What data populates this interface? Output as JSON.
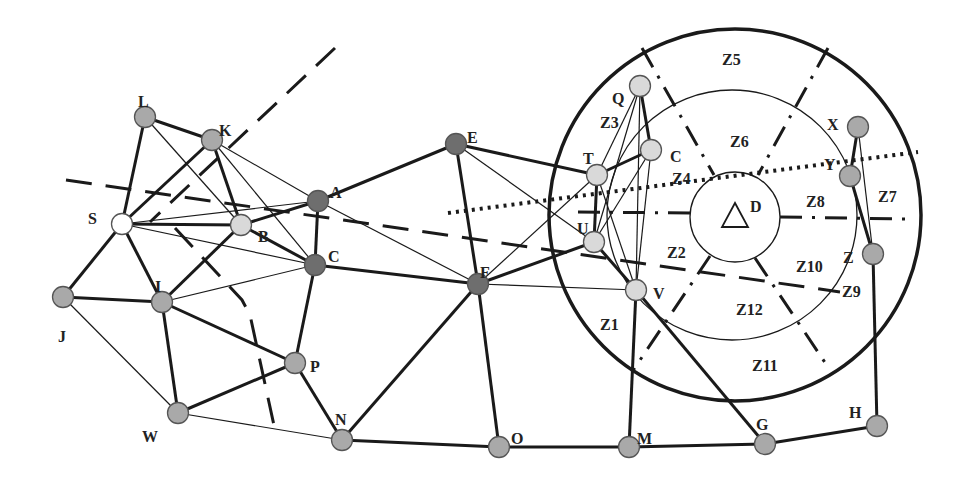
{
  "diagram": {
    "type": "network-graph-with-zones",
    "colors": {
      "edge": "#1a1a1a",
      "node_gray": "#a9a9a9",
      "node_dark": "#6e6e6e",
      "node_light": "#d9d9d9",
      "node_white": "#ffffff",
      "node_stroke": "#555555"
    },
    "nodes": [
      {
        "id": "L",
        "label": "L",
        "x": 145,
        "y": 117,
        "shade": "gray",
        "lx": 138,
        "ly": 95
      },
      {
        "id": "K",
        "label": "K",
        "x": 212,
        "y": 140,
        "shade": "gray",
        "lx": 219,
        "ly": 124
      },
      {
        "id": "S",
        "label": "S",
        "x": 122,
        "y": 224,
        "shade": "white",
        "lx": 88,
        "ly": 212
      },
      {
        "id": "B",
        "label": "B",
        "x": 241,
        "y": 225,
        "shade": "light",
        "lx": 258,
        "ly": 230
      },
      {
        "id": "A",
        "label": "A",
        "x": 318,
        "y": 201,
        "shade": "dark",
        "lx": 330,
        "ly": 186
      },
      {
        "id": "C",
        "label": "C",
        "x": 315,
        "y": 265,
        "shade": "dark",
        "lx": 328,
        "ly": 250
      },
      {
        "id": "I",
        "label": "I",
        "x": 162,
        "y": 302,
        "shade": "gray",
        "lx": 155,
        "ly": 280
      },
      {
        "id": "J",
        "label": "J",
        "x": 63,
        "y": 297,
        "shade": "gray",
        "lx": 58,
        "ly": 330
      },
      {
        "id": "P",
        "label": "P",
        "x": 295,
        "y": 363,
        "shade": "gray",
        "lx": 310,
        "ly": 360
      },
      {
        "id": "W",
        "label": "W",
        "x": 178,
        "y": 413,
        "shade": "gray",
        "lx": 142,
        "ly": 430
      },
      {
        "id": "N",
        "label": "N",
        "x": 342,
        "y": 440,
        "shade": "gray",
        "lx": 335,
        "ly": 413
      },
      {
        "id": "E",
        "label": "E",
        "x": 456,
        "y": 144,
        "shade": "dark",
        "lx": 467,
        "ly": 131
      },
      {
        "id": "F",
        "label": "F",
        "x": 478,
        "y": 284,
        "shade": "dark",
        "lx": 480,
        "ly": 266
      },
      {
        "id": "O",
        "label": "O",
        "x": 499,
        "y": 447,
        "shade": "gray",
        "lx": 511,
        "ly": 432
      },
      {
        "id": "T",
        "label": "T",
        "x": 597,
        "y": 175,
        "shade": "light",
        "lx": 583,
        "ly": 152
      },
      {
        "id": "U",
        "label": "U",
        "x": 594,
        "y": 242,
        "shade": "light",
        "lx": 577,
        "ly": 222
      },
      {
        "id": "V",
        "label": "V",
        "x": 636,
        "y": 290,
        "shade": "light",
        "lx": 653,
        "ly": 287
      },
      {
        "id": "Q",
        "label": "Q",
        "x": 640,
        "y": 86,
        "shade": "light",
        "lx": 612,
        "ly": 92
      },
      {
        "id": "C2",
        "label": "C",
        "x": 651,
        "y": 150,
        "shade": "light",
        "lx": 670,
        "ly": 150
      },
      {
        "id": "X",
        "label": "X",
        "x": 858,
        "y": 127,
        "shade": "gray",
        "lx": 827,
        "ly": 118
      },
      {
        "id": "Y",
        "label": "Y",
        "x": 850,
        "y": 176,
        "shade": "gray",
        "lx": 824,
        "ly": 158
      },
      {
        "id": "Z",
        "label": "Z",
        "x": 873,
        "y": 254,
        "shade": "gray",
        "lx": 843,
        "ly": 251
      },
      {
        "id": "H",
        "label": "H",
        "x": 877,
        "y": 426,
        "shade": "gray",
        "lx": 849,
        "ly": 406
      },
      {
        "id": "G",
        "label": "G",
        "x": 765,
        "y": 444,
        "shade": "gray",
        "lx": 756,
        "ly": 418
      },
      {
        "id": "M",
        "label": "M",
        "x": 629,
        "y": 447,
        "shade": "gray",
        "lx": 637,
        "ly": 432
      }
    ],
    "base_station": {
      "label": "D",
      "x": 735,
      "y": 216,
      "lx": 750,
      "ly": 200
    },
    "zones": [
      {
        "label": "Z1",
        "x": 600,
        "y": 318
      },
      {
        "label": "Z2",
        "x": 667,
        "y": 246
      },
      {
        "label": "Z3",
        "x": 600,
        "y": 116
      },
      {
        "label": "Z4",
        "x": 672,
        "y": 172
      },
      {
        "label": "Z5",
        "x": 722,
        "y": 53
      },
      {
        "label": "Z6",
        "x": 730,
        "y": 135
      },
      {
        "label": "Z7",
        "x": 878,
        "y": 190
      },
      {
        "label": "Z8",
        "x": 806,
        "y": 195
      },
      {
        "label": "Z9",
        "x": 842,
        "y": 285
      },
      {
        "label": "Z10",
        "x": 796,
        "y": 260
      },
      {
        "label": "Z11",
        "x": 752,
        "y": 359
      },
      {
        "label": "Z12",
        "x": 736,
        "y": 303
      }
    ],
    "thick_edges": [
      [
        "L",
        "K"
      ],
      [
        "L",
        "S"
      ],
      [
        "K",
        "S"
      ],
      [
        "K",
        "B"
      ],
      [
        "S",
        "B"
      ],
      [
        "B",
        "C"
      ],
      [
        "B",
        "A"
      ],
      [
        "B",
        "I"
      ],
      [
        "S",
        "J"
      ],
      [
        "S",
        "I"
      ],
      [
        "J",
        "I"
      ],
      [
        "I",
        "W"
      ],
      [
        "I",
        "P"
      ],
      [
        "W",
        "P"
      ],
      [
        "C",
        "P"
      ],
      [
        "A",
        "C"
      ],
      [
        "P",
        "N"
      ],
      [
        "N",
        "F"
      ],
      [
        "N",
        "O"
      ],
      [
        "O",
        "M"
      ],
      [
        "M",
        "G"
      ],
      [
        "G",
        "H"
      ],
      [
        "H",
        "Z"
      ],
      [
        "A",
        "E"
      ],
      [
        "C",
        "F"
      ],
      [
        "E",
        "F"
      ],
      [
        "E",
        "T"
      ],
      [
        "F",
        "O"
      ],
      [
        "F",
        "U"
      ],
      [
        "T",
        "U"
      ],
      [
        "T",
        "C2"
      ],
      [
        "Q",
        "C2"
      ],
      [
        "U",
        "V"
      ],
      [
        "V",
        "G"
      ],
      [
        "V",
        "M"
      ],
      [
        "X",
        "Y"
      ],
      [
        "Y",
        "Z"
      ]
    ],
    "thin_edges": [
      [
        "L",
        "B"
      ],
      [
        "K",
        "C"
      ],
      [
        "K",
        "A"
      ],
      [
        "S",
        "A"
      ],
      [
        "S",
        "C"
      ],
      [
        "I",
        "C"
      ],
      [
        "J",
        "W"
      ],
      [
        "W",
        "N"
      ],
      [
        "A",
        "F"
      ],
      [
        "E",
        "U"
      ],
      [
        "F",
        "V"
      ],
      [
        "F",
        "T"
      ],
      [
        "Q",
        "T"
      ],
      [
        "Q",
        "U"
      ],
      [
        "Q",
        "V"
      ],
      [
        "C2",
        "U"
      ],
      [
        "C2",
        "V"
      ],
      [
        "T",
        "V"
      ],
      [
        "X",
        "Z"
      ]
    ]
  }
}
